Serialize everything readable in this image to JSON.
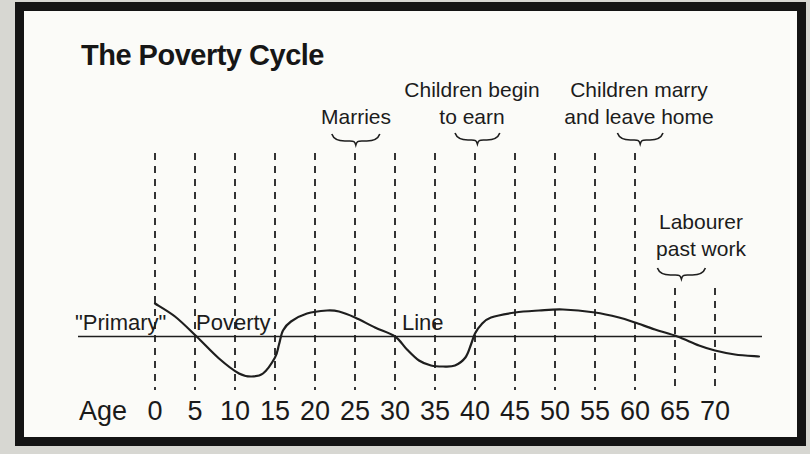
{
  "figure": {
    "title": "The Poverty Cycle"
  },
  "chart_data": {
    "type": "line",
    "title": "The Poverty Cycle",
    "xlabel": "Age",
    "x_ticks": [
      0,
      5,
      10,
      15,
      20,
      25,
      30,
      35,
      40,
      45,
      50,
      55,
      60,
      65,
      70
    ],
    "x_range": [
      0,
      75.5
    ],
    "grid": "dashed-vertical",
    "baseline_words": [
      {
        "text": "\"Primary\"",
        "x": 75
      },
      {
        "text": "Poverty",
        "x": 196
      },
      {
        "text": "Line",
        "x": 402
      }
    ],
    "curve_description": "Well-being relative to the primary poverty line (positive = above line), by age",
    "curve_points_age_offset": [
      [
        0,
        33
      ],
      [
        2.5,
        20
      ],
      [
        5.2,
        0
      ],
      [
        8,
        -22
      ],
      [
        10.5,
        -37
      ],
      [
        12,
        -40
      ],
      [
        13.5,
        -37
      ],
      [
        15,
        -21
      ],
      [
        15.5,
        -8
      ],
      [
        16,
        6
      ],
      [
        17,
        15
      ],
      [
        19,
        23
      ],
      [
        21.5,
        26
      ],
      [
        23,
        25
      ],
      [
        25,
        19
      ],
      [
        27.5,
        9
      ],
      [
        30,
        0
      ],
      [
        31.5,
        -13
      ],
      [
        33,
        -24
      ],
      [
        34.5,
        -29
      ],
      [
        36,
        -30
      ],
      [
        37.5,
        -29
      ],
      [
        38.8,
        -21
      ],
      [
        39.5,
        -8
      ],
      [
        40,
        3
      ],
      [
        40.8,
        12
      ],
      [
        42,
        19
      ],
      [
        45,
        24
      ],
      [
        48,
        26
      ],
      [
        51,
        27
      ],
      [
        55,
        24
      ],
      [
        58,
        19
      ],
      [
        60,
        14
      ],
      [
        62.5,
        7
      ],
      [
        65.3,
        0
      ],
      [
        68,
        -9
      ],
      [
        70,
        -14
      ],
      [
        72.5,
        -18
      ],
      [
        75.5,
        -20
      ]
    ],
    "annotations": [
      {
        "id": "marries",
        "lines": [
          "Marries"
        ],
        "brace_ages": [
          22.1,
          28.1
        ],
        "label_center_x": 356,
        "label_top": 103,
        "brace_top": 134
      },
      {
        "id": "children-begin-to-earn",
        "lines": [
          "Children begin",
          "to earn"
        ],
        "brace_ages": [
          37.5,
          43.1
        ],
        "label_center_x": 472,
        "label_top": 76,
        "brace_top": 133
      },
      {
        "id": "children-marry-and-leave-home",
        "lines": [
          "Children marry",
          "and leave home"
        ],
        "brace_ages": [
          57.8,
          63.5
        ],
        "label_center_x": 639,
        "label_top": 76,
        "brace_top": 133
      },
      {
        "id": "labourer-past-work",
        "lines": [
          "Labourer",
          "past work"
        ],
        "brace_ages": [
          62.8,
          68.8
        ],
        "label_center_x": 701,
        "label_top": 208,
        "brace_top": 268
      }
    ],
    "layout": {
      "x_of_age0": 155,
      "px_per_year": 8,
      "baseline_y": 336.5,
      "dash_top": 153,
      "dash_top_short": 288,
      "dash_bottom": 390,
      "short_lines_from_age": 65,
      "hline_x": [
        78,
        762
      ],
      "axis_labels_top": 396,
      "age_word_center_x": 103,
      "ink_color": "#1e1e1e"
    }
  }
}
